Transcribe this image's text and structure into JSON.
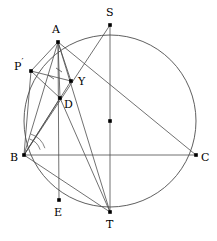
{
  "figure": {
    "type": "geometry-diagram",
    "width": 217,
    "height": 241,
    "colors": {
      "stroke": "#4d4d4d",
      "point": "#000000",
      "label": "#000000",
      "background": "#ffffff"
    },
    "circle": {
      "name": "circumcircle",
      "cx": 110,
      "cy": 121,
      "r": 86
    },
    "points": [
      {
        "id": "A",
        "label": "A",
        "x": 58,
        "y": 42,
        "lx": 52,
        "ly": 24,
        "prime": false
      },
      {
        "id": "S",
        "label": "S",
        "x": 110,
        "y": 25,
        "lx": 106,
        "ly": 7,
        "prime": false
      },
      {
        "id": "P",
        "label": "P",
        "x": 31,
        "y": 71,
        "lx": 14,
        "ly": 58,
        "prime": true
      },
      {
        "id": "Y",
        "label": "Y",
        "x": 71,
        "y": 81,
        "lx": 78,
        "ly": 76,
        "prime": false
      },
      {
        "id": "D",
        "label": "D",
        "x": 60,
        "y": 98,
        "lx": 64,
        "ly": 99,
        "prime": false
      },
      {
        "id": "B",
        "label": "B",
        "x": 24,
        "y": 155,
        "lx": 10,
        "ly": 152,
        "prime": false
      },
      {
        "id": "C",
        "label": "C",
        "x": 196,
        "y": 155,
        "lx": 201,
        "ly": 152,
        "prime": false
      },
      {
        "id": "O",
        "label": "",
        "x": 110,
        "y": 121,
        "lx": 0,
        "ly": 0,
        "prime": false
      },
      {
        "id": "E",
        "label": "E",
        "x": 59,
        "y": 200,
        "lx": 54,
        "ly": 207,
        "prime": false
      },
      {
        "id": "T",
        "label": "T",
        "x": 110,
        "y": 212,
        "lx": 106,
        "ly": 219,
        "prime": false
      }
    ],
    "segments": [
      {
        "name": "segment-BC",
        "from": "B",
        "to": "C"
      },
      {
        "name": "segment-AB",
        "from": "A",
        "to": "B"
      },
      {
        "name": "segment-AP",
        "from": "A",
        "to": "P"
      },
      {
        "name": "segment-PB",
        "from": "P",
        "to": "B"
      },
      {
        "name": "segment-AD",
        "from": "A",
        "to": "D"
      },
      {
        "name": "segment-AE",
        "from": "A",
        "to": "E"
      },
      {
        "name": "segment-AY",
        "from": "A",
        "to": "Y"
      },
      {
        "name": "segment-AT",
        "from": "A",
        "to": "T"
      },
      {
        "name": "segment-AC",
        "from": "A",
        "to": "C"
      },
      {
        "name": "segment-PY",
        "from": "P",
        "to": "Y"
      },
      {
        "name": "segment-PD",
        "from": "P",
        "to": "D"
      },
      {
        "name": "segment-BY",
        "from": "B",
        "to": "Y"
      },
      {
        "name": "segment-BD",
        "from": "B",
        "to": "D"
      },
      {
        "name": "segment-ST",
        "from": "S",
        "to": "T"
      },
      {
        "name": "segment-SB",
        "from": "S",
        "to": "B"
      },
      {
        "name": "segment-BT",
        "from": "B",
        "to": "T"
      },
      {
        "name": "segment-DT",
        "from": "D",
        "to": "T"
      }
    ],
    "tick_marks": [
      {
        "name": "tick-on-AD",
        "x": 59,
        "y": 70
      },
      {
        "name": "tick-on-PY",
        "x": 51,
        "y": 77
      }
    ],
    "angle_arcs": [
      {
        "name": "angle-arc-at-B-outer",
        "cx": 24,
        "cy": 155,
        "r": 22
      },
      {
        "name": "angle-arc-at-B-inner",
        "cx": 24,
        "cy": 155,
        "r": 17
      }
    ]
  }
}
